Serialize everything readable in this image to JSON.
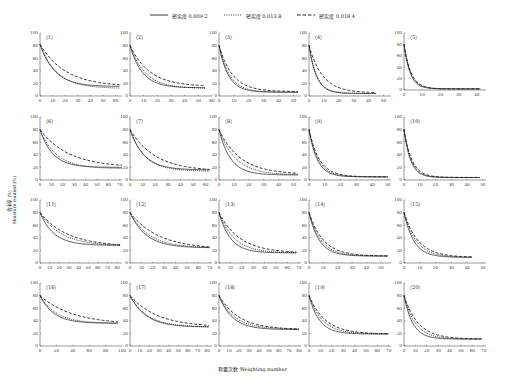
{
  "figure": {
    "xlabel": "称量次数 Weighting number",
    "ylabel_cn": "含水率（%）",
    "ylabel_en": "Moisture content (%)",
    "caption": ""
  },
  "legend": [
    {
      "label": "密实度 0.009 2",
      "style": "solid"
    },
    {
      "label": "密实度 0.013 8",
      "style": "dotted"
    },
    {
      "label": "密实度 0.018 4",
      "style": "dashed"
    }
  ],
  "chart_data": {
    "type": "line",
    "title": "",
    "xlabel": "称量次数 Weighting number",
    "ylabel": "含水率（%） Moisture content (%)",
    "ylim": [
      0,
      100
    ],
    "yticks": [
      0,
      20,
      40,
      60,
      80,
      100
    ],
    "grid": false,
    "legend_position": "top-center",
    "series_names": [
      "密实度 0.009 2",
      "密实度 0.013 8",
      "密实度 0.018 4"
    ],
    "panels": [
      {
        "id": "(1)",
        "xmax": 65,
        "xticks": [
          0,
          10,
          20,
          30,
          40,
          50,
          60
        ],
        "y0": 82,
        "asym": [
          15,
          12,
          15
        ],
        "k": [
          0.085,
          0.075,
          0.05
        ],
        "xend": 63
      },
      {
        "id": "(2)",
        "xmax": 60,
        "xticks": [
          0,
          10,
          20,
          30,
          40,
          50,
          60
        ],
        "y0": 80,
        "asym": [
          13,
          12,
          15
        ],
        "k": [
          0.11,
          0.09,
          0.07
        ],
        "xend": 55
      },
      {
        "id": "(3)",
        "xmax": 55,
        "xticks": [
          0,
          10,
          20,
          30,
          40,
          50
        ],
        "y0": 80,
        "asym": [
          6,
          6,
          7
        ],
        "k": [
          0.16,
          0.14,
          0.11
        ],
        "xend": 53
      },
      {
        "id": "(4)",
        "xmax": 55,
        "xticks": [
          0,
          10,
          20,
          30,
          40,
          50
        ],
        "y0": 80,
        "asym": [
          4,
          4,
          5
        ],
        "k": [
          0.2,
          0.19,
          0.11
        ],
        "xend": 45
      },
      {
        "id": "(5)",
        "xmax": 45,
        "xticks": [
          0,
          10,
          20,
          30,
          40
        ],
        "y0": 80,
        "asym": [
          2,
          2,
          2
        ],
        "k": [
          0.3,
          0.28,
          0.26
        ],
        "xend": 42
      },
      {
        "id": "(6)",
        "xmax": 72,
        "xticks": [
          0,
          10,
          20,
          30,
          40,
          50,
          60,
          70
        ],
        "y0": 80,
        "asym": [
          20,
          18,
          20
        ],
        "k": [
          0.09,
          0.07,
          0.04
        ],
        "xend": 72
      },
      {
        "id": "(7)",
        "xmax": 65,
        "xticks": [
          0,
          10,
          20,
          30,
          40,
          50,
          60
        ],
        "y0": 80,
        "asym": [
          16,
          14,
          14
        ],
        "k": [
          0.09,
          0.085,
          0.05
        ],
        "xend": 63
      },
      {
        "id": "(8)",
        "xmax": 55,
        "xticks": [
          0,
          10,
          20,
          30,
          40,
          50
        ],
        "y0": 80,
        "asym": [
          8,
          8,
          9
        ],
        "k": [
          0.13,
          0.09,
          0.07
        ],
        "xend": 53
      },
      {
        "id": "(9)",
        "xmax": 52,
        "xticks": [
          0,
          10,
          20,
          30,
          40,
          50
        ],
        "y0": 80,
        "asym": [
          5,
          5,
          5
        ],
        "k": [
          0.19,
          0.17,
          0.15
        ],
        "xend": 50
      },
      {
        "id": "(10)",
        "xmax": 52,
        "xticks": [
          0,
          10,
          20,
          30,
          40,
          50
        ],
        "y0": 80,
        "asym": [
          4,
          4,
          4
        ],
        "k": [
          0.24,
          0.22,
          0.2
        ],
        "xend": 48
      },
      {
        "id": "(11)",
        "xmax": 85,
        "xticks": [
          0,
          10,
          20,
          30,
          40,
          50,
          60,
          70,
          80
        ],
        "y0": 80,
        "asym": [
          28,
          27,
          26
        ],
        "k": [
          0.07,
          0.045,
          0.035
        ],
        "xend": 83
      },
      {
        "id": "(12)",
        "xmax": 72,
        "xticks": [
          0,
          10,
          20,
          30,
          40,
          50,
          60,
          70
        ],
        "y0": 80,
        "asym": [
          24,
          24,
          22
        ],
        "k": [
          0.07,
          0.06,
          0.04
        ],
        "xend": 70
      },
      {
        "id": "(13)",
        "xmax": 72,
        "xticks": [
          0,
          10,
          20,
          30,
          40,
          50,
          60,
          70
        ],
        "y0": 80,
        "asym": [
          16,
          16,
          16
        ],
        "k": [
          0.1,
          0.075,
          0.055
        ],
        "xend": 68
      },
      {
        "id": "(14)",
        "xmax": 57,
        "xticks": [
          0,
          10,
          20,
          30,
          40,
          50
        ],
        "y0": 80,
        "asym": [
          11,
          11,
          11
        ],
        "k": [
          0.14,
          0.12,
          0.1
        ],
        "xend": 55
      },
      {
        "id": "(15)",
        "xmax": 52,
        "xticks": [
          0,
          10,
          20,
          30,
          40,
          50
        ],
        "y0": 80,
        "asym": [
          9,
          9,
          9
        ],
        "k": [
          0.16,
          0.13,
          0.11
        ],
        "xend": 43
      },
      {
        "id": "(16)",
        "xmax": 100,
        "xticks": [
          0,
          20,
          40,
          60,
          80,
          100
        ],
        "y0": 80,
        "asym": [
          36,
          36,
          34
        ],
        "k": [
          0.06,
          0.05,
          0.025
        ],
        "xend": 95
      },
      {
        "id": "(17)",
        "xmax": 85,
        "xticks": [
          0,
          10,
          20,
          30,
          40,
          50,
          60,
          70,
          80
        ],
        "y0": 80,
        "asym": [
          30,
          30,
          30
        ],
        "k": [
          0.06,
          0.055,
          0.035
        ],
        "xend": 82
      },
      {
        "id": "(18)",
        "xmax": 82,
        "xticks": [
          0,
          10,
          20,
          30,
          40,
          50,
          60,
          70,
          80
        ],
        "y0": 80,
        "asym": [
          26,
          27,
          26
        ],
        "k": [
          0.075,
          0.065,
          0.05
        ],
        "xend": 80
      },
      {
        "id": "(19)",
        "xmax": 72,
        "xticks": [
          0,
          10,
          20,
          30,
          40,
          50,
          60,
          70
        ],
        "y0": 80,
        "asym": [
          19,
          19,
          19
        ],
        "k": [
          0.11,
          0.085,
          0.07
        ],
        "xend": 70
      },
      {
        "id": "(20)",
        "xmax": 72,
        "xticks": [
          0,
          10,
          20,
          30,
          40,
          50,
          60,
          70
        ],
        "y0": 80,
        "asym": [
          11,
          11,
          11
        ],
        "k": [
          0.13,
          0.1,
          0.08
        ],
        "xend": 68
      }
    ]
  }
}
